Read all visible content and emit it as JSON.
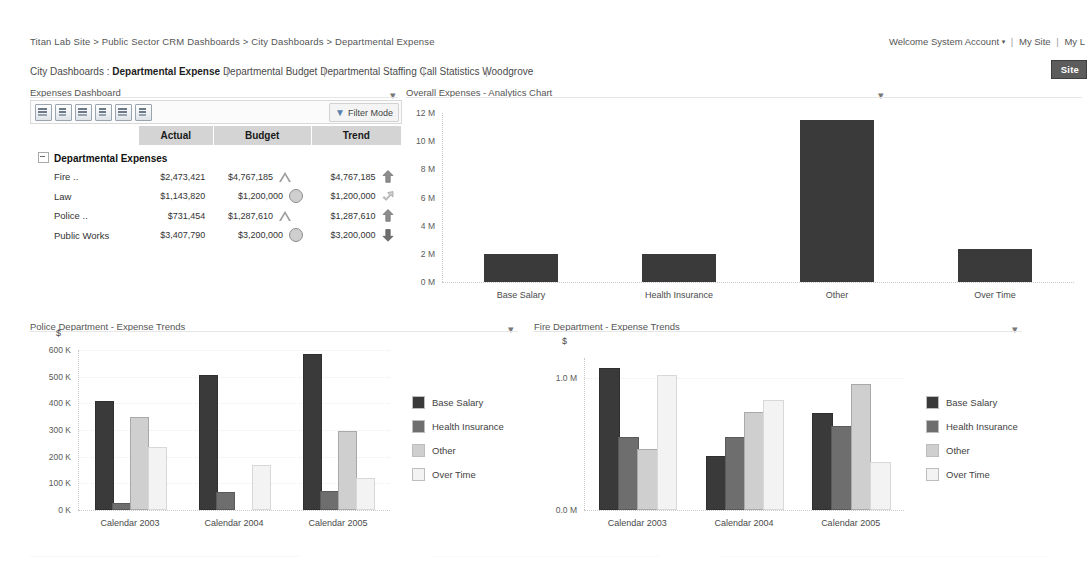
{
  "header": {
    "breadcrumb": "Titan Lab Site > Public Sector CRM Dashboards > City Dashboards > Departmental Expense",
    "welcome_text": "Welcome System Account",
    "welcome_caret": "▾",
    "my_site": "My Site",
    "my_links": "My L",
    "site_button": "Site"
  },
  "nav": {
    "lead_label": "City Dashboards :",
    "items": [
      {
        "label": "Departmental Expense",
        "current": true
      },
      {
        "label": "Departmental Budget",
        "current": false
      },
      {
        "label": "Departmental Staffing",
        "current": false
      },
      {
        "label": "Call Statistics",
        "current": false
      },
      {
        "label": "Woodgrove",
        "current": false
      }
    ]
  },
  "webparts": {
    "expenses_dashboard": "Expenses Dashboard",
    "overall_expenses": "Overall Expenses - Analytics Chart",
    "police_trends": "Police Department - Expense Trends",
    "fire_trends": "Fire Department - Expense Trends",
    "menu_glyph": "▾"
  },
  "scorecard": {
    "filter_mode_label": "Filter Mode",
    "filter_mode_glyph": "▼",
    "toolbar_icons": [
      "refresh-icon",
      "expand-all-icon",
      "collapse-all-icon",
      "export-icon",
      "chart-icon",
      "report-icon"
    ],
    "columns": [
      "",
      "Actual",
      "Budget",
      "Trend"
    ],
    "group_label": "Departmental Expenses",
    "rows": [
      {
        "label": "Fire ..",
        "actual": "$2,473,421",
        "budget": "$4,767,185",
        "budget_ind": "triangle",
        "trend": "$4,767,185",
        "trend_ind": "up"
      },
      {
        "label": "Law",
        "actual": "$1,143,820",
        "budget": "$1,200,000",
        "budget_ind": "circle",
        "trend": "$1,200,000",
        "trend_ind": "flat-up"
      },
      {
        "label": "Police ..",
        "actual": "$731,454",
        "budget": "$1,287,610",
        "budget_ind": "triangle",
        "trend": "$1,287,610",
        "trend_ind": "up"
      },
      {
        "label": "Public Works",
        "actual": "$3,407,790",
        "budget": "$3,200,000",
        "budget_ind": "circle",
        "trend": "$3,200,000",
        "trend_ind": "down"
      }
    ]
  },
  "colors": {
    "base_salary": "#3a3a3a",
    "health_insurance": "#6e6e6e",
    "other": "#cfcfcf",
    "over_time": "#f3f3f3",
    "header_grey": "#d4d4d4",
    "site_button": "#5c5c5c"
  },
  "chart_data": [
    {
      "id": "overall",
      "type": "bar",
      "title": "Overall Expenses - Analytics Chart",
      "xlabel": "",
      "ylabel": "",
      "categories": [
        "Base Salary",
        "Health Insurance",
        "Other",
        "Over Time"
      ],
      "values": [
        2000000,
        2000000,
        11500000,
        2350000
      ],
      "ylim": [
        0,
        12000000
      ],
      "yticks": [
        0,
        2000000,
        4000000,
        6000000,
        8000000,
        10000000,
        12000000
      ],
      "ytick_labels": [
        "0 M",
        "2 M",
        "4 M",
        "6 M",
        "8 M",
        "10 M",
        "12 M"
      ],
      "grid": false,
      "legend": "none",
      "bar_color": "#3a3a3a"
    },
    {
      "id": "police",
      "type": "bar",
      "title": "Police Department - Expense Trends",
      "unit_label": "$",
      "xlabel": "",
      "ylabel": "",
      "categories": [
        "Calendar 2003",
        "Calendar 2004",
        "Calendar 2005"
      ],
      "series": [
        {
          "name": "Base Salary",
          "values": [
            400000,
            497000,
            578000
          ]
        },
        {
          "name": "Health Insurance",
          "values": [
            18000,
            60000,
            65000
          ]
        },
        {
          "name": "Other",
          "values": [
            343000,
            0,
            290000
          ]
        },
        {
          "name": "Over Time",
          "values": [
            230000,
            160000,
            113000
          ]
        }
      ],
      "ylim": [
        0,
        600000
      ],
      "yticks": [
        0,
        100000,
        200000,
        300000,
        400000,
        500000,
        600000
      ],
      "ytick_labels": [
        "0 K",
        "100 K",
        "200 K",
        "300 K",
        "400 K",
        "500 K",
        "600 K"
      ],
      "grid": true,
      "legend": "right"
    },
    {
      "id": "fire",
      "type": "bar",
      "title": "Fire Department - Expense Trends",
      "unit_label": "$",
      "xlabel": "",
      "ylabel": "",
      "categories": [
        "Calendar 2003",
        "Calendar 2004",
        "Calendar 2005"
      ],
      "series": [
        {
          "name": "Base Salary",
          "values": [
            1060000,
            390000,
            720000
          ]
        },
        {
          "name": "Health Insurance",
          "values": [
            540000,
            540000,
            620000
          ]
        },
        {
          "name": "Other",
          "values": [
            450000,
            730000,
            935000
          ]
        },
        {
          "name": "Over Time",
          "values": [
            1005000,
            820000,
            350000
          ]
        }
      ],
      "ylim": [
        0,
        1150000
      ],
      "yticks": [
        0,
        1000000
      ],
      "ytick_labels": [
        "0.0 M",
        "1.0 M"
      ],
      "grid": true,
      "legend": "right"
    }
  ],
  "legend_entries": [
    "Base Salary",
    "Health Insurance",
    "Other",
    "Over Time"
  ]
}
